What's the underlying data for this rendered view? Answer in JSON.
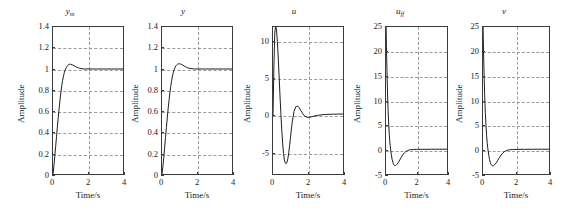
{
  "figure": {
    "caption_fragment": "",
    "background": "#ffffff",
    "axis_color": "#3b3b3b",
    "grid_color": "#9a9a9a",
    "curve_color": "#1a1a1a"
  },
  "common": {
    "xlabel": "Time/s",
    "ylabel": "Amplitude",
    "xticks": [
      "0",
      "2",
      "4"
    ],
    "xlim": [
      0,
      4
    ]
  },
  "chart_data": [
    {
      "type": "line",
      "title": "y",
      "title_sub": "m",
      "xlabel": "Time/s",
      "ylabel": "Amplitude",
      "xlim": [
        0,
        4
      ],
      "ylim": [
        0,
        1.4
      ],
      "xticks": [
        0,
        2,
        4
      ],
      "yticks": [
        0,
        0.2,
        0.4,
        0.6,
        0.8,
        1.0,
        1.2,
        1.4
      ],
      "ytick_labels": [
        "0",
        "0.2",
        "0.4",
        "0.6",
        "0.8",
        "1",
        "1.2",
        "1.4"
      ],
      "grid": true,
      "series": [
        {
          "name": "y_m",
          "x": [
            0,
            0.05,
            0.1,
            0.15,
            0.2,
            0.25,
            0.3,
            0.35,
            0.4,
            0.45,
            0.5,
            0.55,
            0.6,
            0.65,
            0.7,
            0.75,
            0.8,
            0.85,
            0.9,
            0.95,
            1.0,
            1.1,
            1.2,
            1.3,
            1.4,
            1.5,
            1.6,
            1.8,
            2.0,
            2.5,
            3.0,
            3.5,
            4.0
          ],
          "y": [
            0,
            0.075,
            0.165,
            0.26,
            0.355,
            0.45,
            0.54,
            0.625,
            0.705,
            0.775,
            0.84,
            0.892,
            0.935,
            0.968,
            0.993,
            1.012,
            1.026,
            1.036,
            1.042,
            1.045,
            1.045,
            1.04,
            1.031,
            1.022,
            1.014,
            1.008,
            1.004,
            1.0,
            1.0,
            1.0,
            1.0,
            1.0,
            1.0
          ]
        }
      ]
    },
    {
      "type": "line",
      "title": "y",
      "title_sub": "",
      "xlabel": "Time/s",
      "ylabel": "Amplitude",
      "xlim": [
        0,
        4
      ],
      "ylim": [
        0,
        1.4
      ],
      "xticks": [
        0,
        2,
        4
      ],
      "yticks": [
        0,
        0.2,
        0.4,
        0.6,
        0.8,
        1.0,
        1.2,
        1.4
      ],
      "ytick_labels": [
        "0",
        "0.2",
        "0.4",
        "0.6",
        "0.8",
        "1",
        "1.2",
        "1.4"
      ],
      "grid": true,
      "series": [
        {
          "name": "y",
          "x": [
            0,
            0.05,
            0.1,
            0.15,
            0.2,
            0.25,
            0.3,
            0.35,
            0.4,
            0.45,
            0.5,
            0.55,
            0.6,
            0.65,
            0.7,
            0.75,
            0.8,
            0.85,
            0.9,
            0.95,
            1.0,
            1.1,
            1.2,
            1.3,
            1.4,
            1.5,
            1.6,
            1.8,
            2.0,
            2.5,
            3.0,
            3.5,
            4.0
          ],
          "y": [
            0,
            0.07,
            0.158,
            0.252,
            0.348,
            0.443,
            0.534,
            0.62,
            0.7,
            0.772,
            0.836,
            0.89,
            0.934,
            0.969,
            0.996,
            1.016,
            1.031,
            1.041,
            1.047,
            1.05,
            1.05,
            1.045,
            1.035,
            1.025,
            1.016,
            1.009,
            1.005,
            1.001,
            1.0,
            1.0,
            1.0,
            1.0,
            1.0
          ]
        }
      ]
    },
    {
      "type": "line",
      "title": "u",
      "title_sub": "",
      "xlabel": "Time/s",
      "ylabel": "Amplitude",
      "xlim": [
        0,
        4
      ],
      "ylim": [
        -8,
        12
      ],
      "xticks": [
        0,
        2,
        4
      ],
      "yticks": [
        -5,
        0,
        5,
        10
      ],
      "ytick_labels": [
        "-5",
        "0",
        "5",
        "10"
      ],
      "grid": true,
      "series": [
        {
          "name": "u",
          "x": [
            0,
            0.05,
            0.1,
            0.15,
            0.2,
            0.25,
            0.3,
            0.35,
            0.4,
            0.45,
            0.5,
            0.55,
            0.6,
            0.65,
            0.7,
            0.75,
            0.8,
            0.85,
            0.9,
            0.95,
            1.0,
            1.05,
            1.1,
            1.2,
            1.3,
            1.4,
            1.5,
            1.6,
            1.7,
            1.8,
            1.9,
            2.0,
            2.2,
            2.4,
            2.6,
            2.8,
            3.0,
            3.4,
            4.0
          ],
          "y": [
            0,
            6.5,
            11.2,
            12.2,
            11.6,
            10.0,
            7.8,
            5.2,
            2.6,
            0.2,
            -2.0,
            -3.8,
            -5.2,
            -6.1,
            -6.5,
            -6.6,
            -6.4,
            -5.9,
            -5.1,
            -4.1,
            -3.0,
            -1.9,
            -0.9,
            0.5,
            1.15,
            1.25,
            1.0,
            0.6,
            0.2,
            -0.1,
            -0.25,
            -0.3,
            -0.22,
            -0.1,
            0.0,
            0.06,
            0.1,
            0.14,
            0.16
          ]
        }
      ]
    },
    {
      "type": "line",
      "title": "u",
      "title_sub": "ff",
      "xlabel": "Time/s",
      "ylabel": "Amplitude",
      "xlim": [
        0,
        4
      ],
      "ylim": [
        -5,
        25
      ],
      "xticks": [
        0,
        2,
        4
      ],
      "yticks": [
        -5,
        0,
        5,
        10,
        15,
        20,
        25
      ],
      "ytick_labels": [
        "-5",
        "0",
        "5",
        "10",
        "15",
        "20",
        "25"
      ],
      "grid": true,
      "series": [
        {
          "name": "u_ff",
          "x": [
            0,
            0.03,
            0.06,
            0.1,
            0.14,
            0.18,
            0.22,
            0.26,
            0.3,
            0.35,
            0.4,
            0.45,
            0.5,
            0.55,
            0.6,
            0.65,
            0.7,
            0.8,
            0.9,
            1.0,
            1.1,
            1.2,
            1.3,
            1.4,
            1.5,
            1.6,
            1.8,
            2.0,
            2.5,
            3.0,
            3.5,
            4.0
          ],
          "y": [
            26.5,
            21.0,
            16.5,
            11.5,
            7.8,
            5.0,
            2.9,
            1.3,
            0.1,
            -1.1,
            -2.0,
            -2.6,
            -3.05,
            -3.25,
            -3.3,
            -3.25,
            -3.1,
            -2.7,
            -2.15,
            -1.6,
            -1.1,
            -0.7,
            -0.42,
            -0.24,
            -0.12,
            -0.05,
            0.0,
            0.02,
            0.04,
            0.05,
            0.06,
            0.06
          ]
        }
      ]
    },
    {
      "type": "line",
      "title": "v",
      "title_sub": "",
      "xlabel": "Time/s",
      "ylabel": "Amplitude",
      "xlim": [
        0,
        4
      ],
      "ylim": [
        -5,
        25
      ],
      "xticks": [
        0,
        2,
        4
      ],
      "yticks": [
        -5,
        0,
        5,
        10,
        15,
        20,
        25
      ],
      "ytick_labels": [
        "-5",
        "0",
        "5",
        "10",
        "15",
        "20",
        "25"
      ],
      "grid": true,
      "series": [
        {
          "name": "v",
          "x": [
            0,
            0.03,
            0.06,
            0.1,
            0.14,
            0.18,
            0.22,
            0.26,
            0.3,
            0.35,
            0.4,
            0.45,
            0.5,
            0.55,
            0.6,
            0.65,
            0.7,
            0.8,
            0.9,
            1.0,
            1.1,
            1.2,
            1.3,
            1.4,
            1.5,
            1.6,
            1.8,
            2.0,
            2.5,
            3.0,
            3.5,
            4.0
          ],
          "y": [
            26.0,
            20.5,
            16.0,
            11.2,
            7.6,
            4.9,
            2.8,
            1.2,
            0.0,
            -1.2,
            -2.1,
            -2.7,
            -3.1,
            -3.3,
            -3.35,
            -3.28,
            -3.12,
            -2.72,
            -2.18,
            -1.62,
            -1.12,
            -0.72,
            -0.44,
            -0.25,
            -0.13,
            -0.06,
            0.0,
            0.02,
            0.04,
            0.05,
            0.06,
            0.06
          ]
        }
      ]
    }
  ]
}
